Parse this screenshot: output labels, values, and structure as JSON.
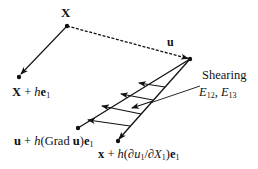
{
  "diagram": {
    "colors": {
      "stroke": "#111111",
      "background": "#ffffff"
    },
    "points": {
      "X": {
        "label": "X",
        "x": 67,
        "y": 26
      },
      "X_plus_he1": {
        "label": "X + he₁",
        "x": 19,
        "y": 76
      },
      "u_tip": {
        "label": "u",
        "x": 190,
        "y": 59
      },
      "u_plus_grad": {
        "label": "u + h(Grad u)e₁",
        "x": 78,
        "y": 128
      },
      "x_plus_partial": {
        "label": "x + h(∂u₁/∂X₁)e₁",
        "x": 118,
        "y": 141
      }
    },
    "labels": {
      "X": "X",
      "u": "u",
      "X_plus_he1_main": "X + ",
      "X_plus_he1_h": "h",
      "X_plus_he1_e": "e",
      "X_plus_he1_sub": "1",
      "shearing": "Shearing",
      "E12": "E",
      "E12_sub": "12",
      "comma": ", ",
      "E13": "E",
      "E13_sub": "13",
      "grad_u": "u",
      "grad_plus": " + ",
      "grad_h": "h",
      "grad_open": "(Grad ",
      "grad_u2": "u",
      "grad_close": ")",
      "grad_e": "e",
      "grad_sub": "1",
      "x_bold": "x",
      "x_plus": " + ",
      "x_h": "h",
      "x_open": "(∂",
      "x_u": "u",
      "x_u_sub": "1",
      "x_slash": "/∂",
      "x_X": "X",
      "x_X_sub": "1",
      "x_close": ")",
      "x_e": "e",
      "x_e_sub": "1"
    },
    "shear_arrows_count": 5
  }
}
